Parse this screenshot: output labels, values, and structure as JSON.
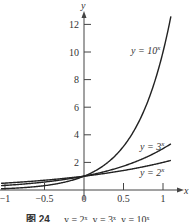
{
  "chart_data": {
    "type": "line",
    "title": "",
    "xlabel": "x",
    "ylabel": "y",
    "xlim": [
      -1.05,
      1.1
    ],
    "ylim": [
      0,
      13
    ],
    "x_ticks": [
      "−1",
      "−0.5",
      "0",
      "0.5",
      "1"
    ],
    "y_ticks": [
      "2",
      "4",
      "6",
      "8",
      "10",
      "12"
    ],
    "grid": false,
    "series": [
      {
        "name": "y = 2^x",
        "label": "y = 2",
        "exp": "x",
        "base": 2,
        "x": [
          -1.05,
          -1,
          -0.5,
          0,
          0.5,
          1,
          1.1
        ],
        "values": [
          0.48,
          0.5,
          0.71,
          1,
          1.41,
          2,
          2.14
        ]
      },
      {
        "name": "y = 3^x",
        "label": "y = 3",
        "exp": "x",
        "base": 3,
        "x": [
          -1.05,
          -1,
          -0.5,
          0,
          0.5,
          1,
          1.1
        ],
        "values": [
          0.32,
          0.33,
          0.58,
          1,
          1.73,
          3,
          3.35
        ]
      },
      {
        "name": "y = 10^x",
        "label": "y = 10",
        "exp": "x",
        "base": 10,
        "x": [
          -1.05,
          -1,
          -0.5,
          0,
          0.5,
          1,
          1.1
        ],
        "values": [
          0.09,
          0.1,
          0.32,
          1,
          3.16,
          10,
          12.59
        ]
      }
    ]
  },
  "caption": {
    "figure": "图 24",
    "text": "y = 2ˣ, y = 3ˣ, y = 10ˣ"
  }
}
